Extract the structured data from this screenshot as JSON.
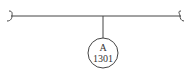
{
  "diagram": {
    "node": {
      "line1": "A",
      "line2": "1301"
    },
    "colors": {
      "stroke": "#444444",
      "background": "#ffffff"
    }
  }
}
